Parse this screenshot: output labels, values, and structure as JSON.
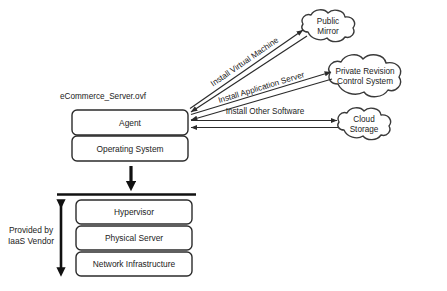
{
  "diagram": {
    "title": "eCommerce_Server.ovf",
    "vm_stack": [
      {
        "label": "Agent"
      },
      {
        "label": "Operating System"
      }
    ],
    "infra_stack": [
      {
        "label": "Hypervisor"
      },
      {
        "label": "Physical Server"
      },
      {
        "label": "Network Infrastructure"
      }
    ],
    "vendor_note": {
      "line1": "Provided by",
      "line2": "IaaS Vendor"
    },
    "clouds": [
      {
        "id": "public-mirror",
        "line1": "Public",
        "line2": "Mirror"
      },
      {
        "id": "private-revision-control-system",
        "line1": "Private Revision",
        "line2": "Control System"
      },
      {
        "id": "cloud-storage",
        "line1": "Cloud",
        "line2": "Storage"
      }
    ],
    "edges": [
      {
        "id": "install-virtual-machine",
        "label": "Install Virtual Machine"
      },
      {
        "id": "install-application-server",
        "label": "Install Application Server"
      },
      {
        "id": "install-other-software",
        "label": "Install Other Software"
      }
    ],
    "colors": {
      "stroke": "#2b2b2b",
      "cloud_stroke": "#3a3a3a",
      "heavy": "#111111",
      "background": "#ffffff",
      "text": "#1b1b1b"
    }
  }
}
